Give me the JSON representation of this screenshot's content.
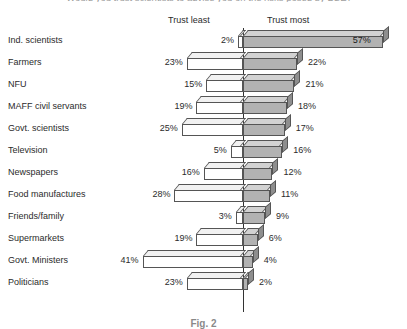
{
  "figure": {
    "question": "Would you trust scientists to advise you on the risks posed by BSE?",
    "caption": "Fig. 2"
  },
  "headers": {
    "left": "Trust least",
    "right": "Trust most"
  },
  "chart_data": {
    "type": "bar",
    "subtype": "diverging-horizontal-3d",
    "title": "Would you trust scientists to advise you on the risks posed by BSE?",
    "xlabel": "",
    "ylabel": "",
    "grid": false,
    "legend_position": "top",
    "axis_center_value": 0,
    "units": "percent",
    "categories": [
      "Ind. scientists",
      "Farmers",
      "NFU",
      "MAFF civil servants",
      "Govt. scientists",
      "Television",
      "Newspapers",
      "Food manufactures",
      "Friends/family",
      "Supermarkets",
      "Govt. Ministers",
      "Politicians"
    ],
    "series": [
      {
        "name": "Trust least",
        "direction": "left",
        "color": "#ffffff",
        "values": [
          2,
          23,
          15,
          19,
          25,
          5,
          16,
          28,
          3,
          19,
          41,
          23
        ],
        "labels": [
          "2%",
          "23%",
          "15%",
          "19%",
          "25%",
          "5%",
          "16%",
          "28%",
          "3%",
          "19%",
          "41%",
          "23%"
        ]
      },
      {
        "name": "Trust most",
        "direction": "right",
        "color": "#b2b2b2",
        "values": [
          57,
          22,
          21,
          18,
          17,
          16,
          12,
          11,
          9,
          6,
          4,
          2
        ],
        "labels": [
          "57%",
          "22%",
          "21%",
          "18%",
          "17%",
          "16%",
          "12%",
          "11%",
          "9%",
          "6%",
          "4%",
          "2%"
        ]
      }
    ],
    "xlim": [
      -45,
      60
    ]
  }
}
